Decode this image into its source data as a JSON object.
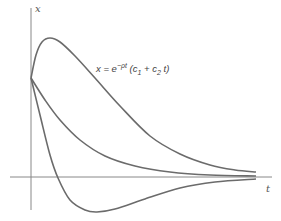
{
  "chart_data": {
    "type": "line",
    "title": "",
    "xlabel": "t",
    "ylabel": "x",
    "annotation": "x = e^{-ρt}(c1 + c2 t)",
    "annotation_parts": {
      "lhs": "x = e",
      "exp": "−ρt",
      "open": " (c",
      "sub1": "1",
      "plus": " + c",
      "sub2": "2",
      "tail": " t)"
    },
    "grid": false,
    "legend": "none",
    "axis_color": "#888888",
    "curve_color": "#6b6b6b",
    "series": [
      {
        "name": "rising then decaying (c2 > ρ c1)",
        "points": [
          [
            31,
            78
          ],
          [
            36,
            55
          ],
          [
            42,
            42
          ],
          [
            50,
            38
          ],
          [
            60,
            42
          ],
          [
            75,
            56
          ],
          [
            95,
            78
          ],
          [
            120,
            106
          ],
          [
            150,
            136
          ],
          [
            180,
            154
          ],
          [
            210,
            165
          ],
          [
            235,
            170
          ],
          [
            256,
            172
          ]
        ]
      },
      {
        "name": "monotone decay",
        "points": [
          [
            31,
            78
          ],
          [
            45,
            100
          ],
          [
            60,
            120
          ],
          [
            80,
            140
          ],
          [
            105,
            156
          ],
          [
            135,
            166
          ],
          [
            170,
            172
          ],
          [
            210,
            175
          ],
          [
            256,
            176
          ]
        ]
      },
      {
        "name": "undershoot (c2 < 0)",
        "points": [
          [
            31,
            78
          ],
          [
            40,
            115
          ],
          [
            50,
            155
          ],
          [
            58,
            178
          ],
          [
            70,
            200
          ],
          [
            85,
            210
          ],
          [
            97,
            212
          ],
          [
            115,
            209
          ],
          [
            145,
            199
          ],
          [
            180,
            188
          ],
          [
            215,
            182
          ],
          [
            256,
            179
          ]
        ]
      }
    ],
    "axes": {
      "origin": [
        31,
        177
      ],
      "x_axis": {
        "from": 10,
        "to": 272
      },
      "y_axis": {
        "from": 8,
        "to": 210
      }
    }
  }
}
